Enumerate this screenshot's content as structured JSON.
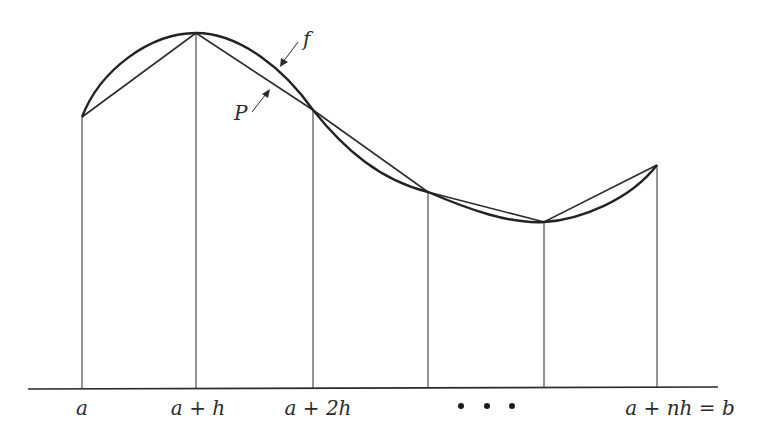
{
  "figure": {
    "curve_label": "f",
    "polyline_label": "P",
    "x_labels": [
      "a",
      "a + h",
      "a + 2h",
      "•   •   •",
      "a + nh = b"
    ],
    "ellipsis": "• • •",
    "colors": {
      "ink": "#2a2a2a",
      "background": "#ffffff"
    }
  },
  "geometry": {
    "baseline_y": 388,
    "nodes": [
      {
        "x": 82,
        "y": 117
      },
      {
        "x": 196,
        "y": 33
      },
      {
        "x": 313,
        "y": 110
      },
      {
        "x": 428,
        "y": 192
      },
      {
        "x": 544,
        "y": 222
      },
      {
        "x": 657,
        "y": 165
      }
    ]
  }
}
